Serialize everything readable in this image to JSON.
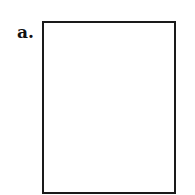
{
  "panel": {
    "label": "a.",
    "border_color": "#1a1a1a",
    "fill_color": "#ffffff"
  }
}
